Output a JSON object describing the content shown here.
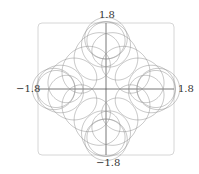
{
  "chart_data": {
    "type": "line",
    "title": "",
    "xlabel": "",
    "ylabel": "",
    "xlim": [
      -1.8,
      1.8
    ],
    "ylim": [
      -1.8,
      1.8
    ],
    "grid": false,
    "legend": null,
    "tick_labels": {
      "x_min": "−1.8",
      "x_max": "1.8",
      "y_min": "−1.8",
      "y_max": "1.8"
    },
    "series": [
      {
        "name": "parametric-curve",
        "parametric": {
          "terms": [
            {
              "amp": 1.1,
              "freq": 1
            },
            {
              "amp": 0.3,
              "freq": -3
            },
            {
              "amp": 0.55,
              "freq": 25
            }
          ],
          "t_range": [
            0,
            6.283185
          ]
        },
        "color": "#8a8a8a"
      }
    ]
  },
  "labels": {
    "top": "1.8",
    "bottom": "−1.8",
    "left": "−1.8",
    "right": "1.8"
  }
}
